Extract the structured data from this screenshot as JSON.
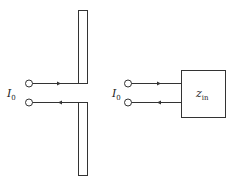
{
  "diagram": {
    "left": {
      "current_label": "I",
      "current_sub": "0",
      "element": "dipole antenna"
    },
    "right": {
      "current_label": "I",
      "current_sub": "0",
      "box_label": "z",
      "box_sub": "in"
    },
    "colors": {
      "stroke": "#333333",
      "background": "#ffffff"
    }
  }
}
